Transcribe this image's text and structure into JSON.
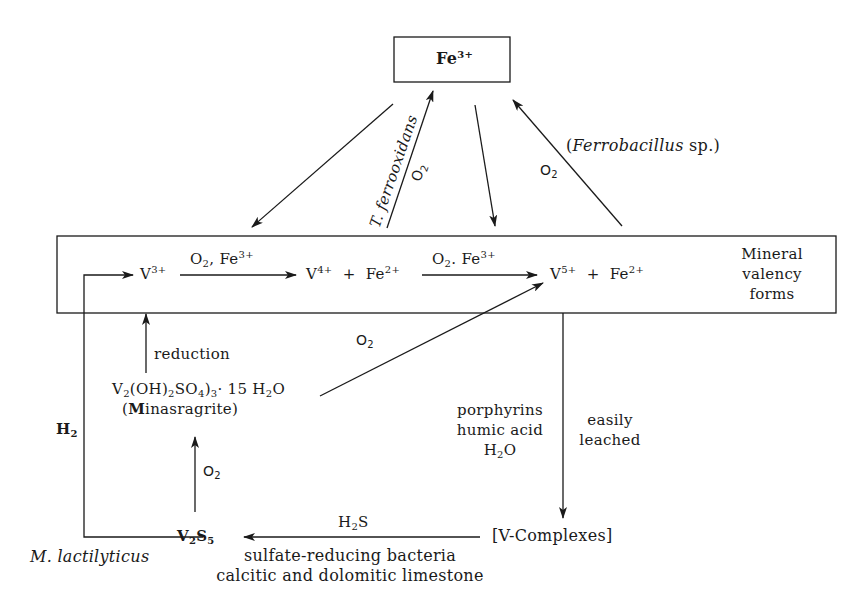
{
  "diagram": {
    "top_box": {
      "base": "Fe",
      "charge": "3+"
    },
    "main_box": {
      "label_lines": [
        "Mineral",
        "valency",
        "forms"
      ],
      "species": {
        "v3": {
          "base": "V",
          "charge": "3+"
        },
        "v4_fe2": {
          "v": "V",
          "v_charge": "4+",
          "plus": "+",
          "fe": "Fe",
          "fe_charge": "2+"
        },
        "v5_fe2": {
          "v": "V",
          "v_charge": "5+",
          "plus": "+",
          "fe": "Fe",
          "fe_charge": "2+"
        }
      },
      "arrow1_label": {
        "o": "O",
        "o_sub": "2",
        "sep": ",",
        "fe": "Fe",
        "fe_charge": "3+"
      },
      "arrow2_label": {
        "o": "O",
        "o_sub": "2",
        "sep": ".",
        "fe": "Fe",
        "fe_charge": "3+"
      }
    },
    "top_arrows": {
      "t_ferrooxidans": "T. ferrooxidans",
      "o2_left": {
        "o": "O",
        "sub": "2"
      },
      "o2_right": {
        "o": "O",
        "sub": "2"
      },
      "ferrobacillus": {
        "open": "(",
        "genus": "Ferrobacillus",
        "rest": " sp.)"
      }
    },
    "lower": {
      "reduction": "reduction",
      "minasragrite_formula": {
        "v": "V",
        "v_sub": "2",
        "oh": "(OH)",
        "oh_sub": "2",
        "so": "SO",
        "so_sub": "4",
        "close": ")",
        "close_sub": "3",
        "rest": "· 15 H",
        "h_sub": "2",
        "o": "O"
      },
      "minasragrite_name": {
        "open": "(",
        "bold": "M",
        "rest": "inasragrite)"
      },
      "o2_diag": {
        "o": "O",
        "sub": "2"
      },
      "o2_up": {
        "o": "O",
        "sub": "2"
      },
      "h2": {
        "h": "H",
        "sub": "2"
      },
      "v2s5": {
        "v": "V",
        "v_sub": "2",
        "s": "S",
        "s_sub": "5"
      },
      "m_lactilyticus": "M. lactilyticus",
      "h2s": {
        "h": "H",
        "sub": "2",
        "s": "S"
      },
      "bottom_lines": [
        "sulfate-reducing bacteria",
        "calcitic and dolomitic limestone"
      ],
      "v_complexes": "[V-Complexes]",
      "organics": [
        "porphyrins",
        "humic acid",
        "H₂O"
      ],
      "organics_h2o": {
        "h": "H",
        "sub": "2",
        "o": "O"
      },
      "easily_leached": [
        "easily",
        "leached"
      ]
    },
    "colors": {
      "ink": "#1a1a1a",
      "background": "#ffffff"
    }
  }
}
